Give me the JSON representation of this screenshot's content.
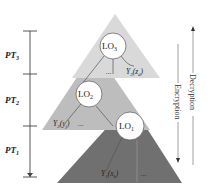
{
  "diagram": {
    "colors": {
      "top_triangle": "#d9d9d9",
      "middle_triangle": "#bdbdbd",
      "bottom_triangle": "#707070",
      "circle_fill": "#ffffff",
      "axis": "#444444"
    },
    "axis": {
      "segments": [
        {
          "label": "PT",
          "sub": "3"
        },
        {
          "label": "PT",
          "sub": "2"
        },
        {
          "label": "PT",
          "sub": "1"
        }
      ]
    },
    "layers": [
      {
        "name": "LO",
        "sub": "3",
        "output_label": "Y",
        "output_sub": "3",
        "output_arg": "(z",
        "output_arg_sub": "d",
        "output_close": ")",
        "ellipsis": "..."
      },
      {
        "name": "LO",
        "sub": "2",
        "output_label": "Y",
        "output_sub": "2",
        "output_arg": "(y",
        "output_arg_sub": "j",
        "output_close": ")",
        "ellipsis": "..."
      },
      {
        "name": "LO",
        "sub": "1",
        "output_label": "Y",
        "output_sub": "1",
        "output_arg": "(x",
        "output_arg_sub": "k",
        "output_close": ")",
        "ellipsis": "..."
      }
    ],
    "arrows": {
      "encryption": "Encryption",
      "decryption": "Decryption"
    }
  }
}
